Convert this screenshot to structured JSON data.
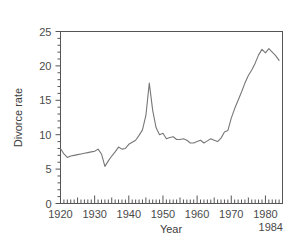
{
  "chart_data": {
    "type": "line",
    "title": "",
    "xlabel": "Year",
    "ylabel": "Divorce rate",
    "xlim": [
      1920,
      1985
    ],
    "ylim": [
      0,
      25
    ],
    "grid": false,
    "legend": null,
    "line_color": "#777777",
    "axis_color": "#555555",
    "background": "#ffffff",
    "xticks_major": [
      1920,
      1930,
      1940,
      1950,
      1960,
      1970,
      1980
    ],
    "xtick_labels": [
      "1920",
      "1930",
      "1940",
      "1950",
      "1960",
      "1970",
      "1980"
    ],
    "xtick_minor_step": 1,
    "xtick_mid_step": 5,
    "yticks_major": [
      0,
      5,
      10,
      15,
      20,
      25
    ],
    "ytick_labels": [
      "0",
      "5",
      "10",
      "15",
      "20",
      "25"
    ],
    "ytick_minor_step": 1,
    "end_annotation": "1984",
    "x": [
      1920,
      1921,
      1922,
      1923,
      1924,
      1925,
      1926,
      1927,
      1928,
      1929,
      1930,
      1931,
      1932,
      1933,
      1934,
      1935,
      1936,
      1937,
      1938,
      1939,
      1940,
      1941,
      1942,
      1943,
      1944,
      1945,
      1946,
      1947,
      1948,
      1949,
      1950,
      1951,
      1952,
      1953,
      1954,
      1955,
      1956,
      1957,
      1958,
      1959,
      1960,
      1961,
      1962,
      1963,
      1964,
      1965,
      1966,
      1967,
      1968,
      1969,
      1970,
      1971,
      1972,
      1973,
      1974,
      1975,
      1976,
      1977,
      1978,
      1979,
      1980,
      1981,
      1982,
      1983,
      1984
    ],
    "y": [
      8.0,
      7.2,
      6.7,
      6.9,
      7.0,
      7.1,
      7.2,
      7.3,
      7.4,
      7.5,
      7.6,
      7.9,
      7.2,
      5.4,
      6.2,
      6.9,
      7.5,
      8.2,
      7.9,
      8.0,
      8.6,
      8.9,
      9.2,
      9.9,
      10.7,
      12.8,
      17.5,
      13.5,
      11.0,
      10.0,
      10.2,
      9.4,
      9.6,
      9.7,
      9.3,
      9.3,
      9.4,
      9.2,
      8.8,
      8.8,
      9.0,
      9.2,
      8.8,
      9.1,
      9.4,
      9.2,
      9.0,
      9.5,
      10.4,
      10.6,
      12.4,
      13.8,
      15.0,
      16.2,
      17.5,
      18.6,
      19.4,
      20.4,
      21.6,
      22.4,
      21.9,
      22.5,
      22.0,
      21.5,
      20.8
    ]
  },
  "axis_labels": {
    "y_axis_title": "Divorce rate",
    "x_axis_title": "Year",
    "end_year_label": "1984"
  }
}
